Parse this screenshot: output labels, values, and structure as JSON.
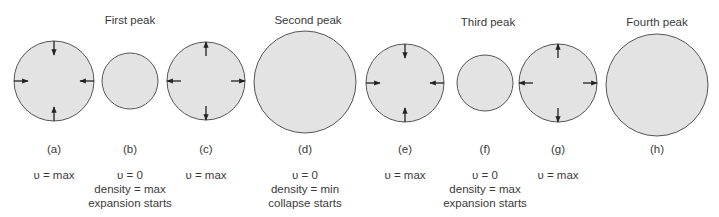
{
  "colors": {
    "circle_fill": "#e3e3e3",
    "circle_stroke": "#555555",
    "arrow": "#222222",
    "text": "#3a3a3a"
  },
  "peaks": [
    {
      "label": "First peak",
      "x": 130,
      "y": 14
    },
    {
      "label": "Second peak",
      "x": 308,
      "y": 14
    },
    {
      "label": "Third peak",
      "x": 488,
      "y": 16
    },
    {
      "label": "Fourth peak",
      "x": 657,
      "y": 16
    }
  ],
  "stages": [
    {
      "id": "a",
      "label": "(a)",
      "cx": 54,
      "cy": 81,
      "r": 40,
      "arrows": "inward",
      "lines": [
        "υ = max"
      ]
    },
    {
      "id": "b",
      "label": "(b)",
      "cx": 130,
      "cy": 81,
      "r": 28,
      "arrows": "none",
      "lines": [
        "υ = 0",
        "density = max",
        "expansion starts"
      ]
    },
    {
      "id": "c",
      "label": "(c)",
      "cx": 206,
      "cy": 81,
      "r": 39,
      "arrows": "outward",
      "lines": [
        "υ = max"
      ]
    },
    {
      "id": "d",
      "label": "(d)",
      "cx": 305,
      "cy": 82,
      "r": 51,
      "arrows": "none",
      "lines": [
        "υ = 0",
        "density = min",
        "collapse starts"
      ]
    },
    {
      "id": "e",
      "label": "(e)",
      "cx": 405,
      "cy": 83,
      "r": 39,
      "arrows": "inward",
      "lines": [
        "υ = max"
      ]
    },
    {
      "id": "f",
      "label": "(f)",
      "cx": 485,
      "cy": 83,
      "r": 28,
      "arrows": "none",
      "lines": [
        "υ = 0",
        "density = max",
        "expansion starts"
      ]
    },
    {
      "id": "g",
      "label": "(g)",
      "cx": 558,
      "cy": 83,
      "r": 39,
      "arrows": "outward",
      "lines": [
        "υ = max"
      ]
    },
    {
      "id": "h",
      "label": "(h)",
      "cx": 657,
      "cy": 85,
      "r": 51,
      "arrows": "none",
      "lines": []
    }
  ],
  "layout": {
    "stage_label_y": 143,
    "desc_y": 168
  }
}
